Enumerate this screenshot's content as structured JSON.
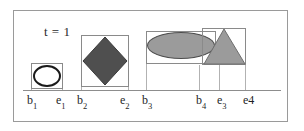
{
  "figure": {
    "time_label": "t = 1",
    "axis": {
      "x_start": 23,
      "x_end": 281,
      "y": 90
    },
    "colors": {
      "frame_border": "#9a9a9a",
      "axis": "#8d8d8d",
      "drop_line": "#b2b2b2",
      "bbox_border": "#8a8a8a",
      "stadium_stroke": "#1a1a1a",
      "stadium_fill": "#ffffff",
      "diamond_fill": "#4f4f4f",
      "ellipse_fill": "#9b9b9b",
      "ellipse_stroke": "#4d4d4d",
      "triangle_fill": "#9b9b9b",
      "triangle_stroke": "#6e6e6e",
      "text": "#1f1f1f"
    },
    "objects": [
      {
        "id": "object-1",
        "shape": "rounded-rectangle",
        "begin_label": "b",
        "begin_sub": "1",
        "end_label": "e",
        "end_sub": "1",
        "box": {
          "x": 30,
          "y": 62,
          "w": 32,
          "h": 26
        }
      },
      {
        "id": "object-2",
        "shape": "diamond",
        "begin_label": "b",
        "begin_sub": "2",
        "end_label": "e",
        "end_sub": "2",
        "box": {
          "x": 80,
          "y": 34,
          "w": 48,
          "h": 52
        }
      },
      {
        "id": "object-3",
        "shape": "ellipse",
        "begin_label": "b",
        "begin_sub": "3",
        "end_label": "e",
        "end_sub": "3",
        "box": {
          "x": 145,
          "y": 30,
          "w": 70,
          "h": 33
        }
      },
      {
        "id": "object-4",
        "shape": "triangle",
        "begin_label": "b",
        "begin_sub": "4",
        "end_label": "e4",
        "end_sub": "",
        "box": {
          "x": 201,
          "y": 27,
          "w": 44,
          "h": 37
        }
      }
    ],
    "tick_labels": [
      {
        "id": "tick-b1",
        "text": "b",
        "sub": "1",
        "x": 27
      },
      {
        "id": "tick-e1",
        "text": "e",
        "sub": "1",
        "x": 56
      },
      {
        "id": "tick-b2",
        "text": "b",
        "sub": "2",
        "x": 77
      },
      {
        "id": "tick-e2",
        "text": "e",
        "sub": "2",
        "x": 120
      },
      {
        "id": "tick-b3",
        "text": "b",
        "sub": "3",
        "x": 142
      },
      {
        "id": "tick-b4",
        "text": "b",
        "sub": "4",
        "x": 196
      },
      {
        "id": "tick-e3",
        "text": "e",
        "sub": "3",
        "x": 217
      },
      {
        "id": "tick-e4",
        "text": "e4",
        "sub": "",
        "x": 243
      }
    ]
  }
}
